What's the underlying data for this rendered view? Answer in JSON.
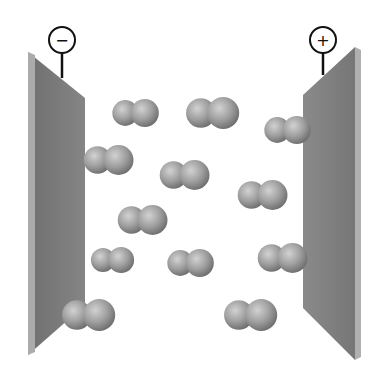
{
  "diagram": {
    "colors": {
      "background": "#ffffff",
      "plate_face": "#7d7d7d",
      "plate_edge": "#a8a8a8",
      "terminal_stroke": "#111111",
      "molecule_light": "#c4c4c4",
      "molecule_mid": "#9a9a9a",
      "molecule_dark": "#6e6e6e"
    },
    "terminals": [
      {
        "id": "negative",
        "symbol": "−",
        "cx": 62,
        "cy": 40
      },
      {
        "id": "positive",
        "symbol": "+",
        "cx": 323,
        "cy": 40
      }
    ],
    "plates": [
      {
        "id": "negative-plate",
        "face": "28,52 28,355 85,305 85,98",
        "edge": "28,52 35,55 35,352 28,355"
      },
      {
        "id": "positive-plate",
        "face": "303,95 303,308 355,360 355,47",
        "edge": "355,47 361,50 361,357 355,360"
      }
    ],
    "molecules": [
      {
        "cx": 135,
        "cy": 113,
        "r": 14
      },
      {
        "cx": 212,
        "cy": 113,
        "r": 16
      },
      {
        "cx": 287,
        "cy": 130,
        "r": 14
      },
      {
        "cx": 108,
        "cy": 160,
        "r": 15
      },
      {
        "cx": 184,
        "cy": 175,
        "r": 15
      },
      {
        "cx": 262,
        "cy": 195,
        "r": 15
      },
      {
        "cx": 142,
        "cy": 220,
        "r": 15
      },
      {
        "cx": 112,
        "cy": 260,
        "r": 13
      },
      {
        "cx": 190,
        "cy": 263,
        "r": 14
      },
      {
        "cx": 282,
        "cy": 258,
        "r": 15
      },
      {
        "cx": 88,
        "cy": 315,
        "r": 16
      },
      {
        "cx": 250,
        "cy": 315,
        "r": 16
      }
    ]
  }
}
